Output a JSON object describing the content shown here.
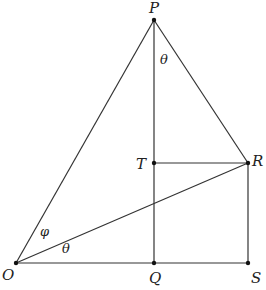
{
  "diagram": {
    "type": "geometry",
    "colors": {
      "line": "#333333",
      "point": "#111111",
      "text": "#222222",
      "background": "#ffffff"
    },
    "points": [
      {
        "id": "P",
        "label": "P",
        "x": 154,
        "y": 20
      },
      {
        "id": "T",
        "label": "T",
        "x": 154,
        "y": 163
      },
      {
        "id": "R",
        "label": "R",
        "x": 248,
        "y": 163
      },
      {
        "id": "O",
        "label": "O",
        "x": 16,
        "y": 263
      },
      {
        "id": "Q",
        "label": "Q",
        "x": 154,
        "y": 263
      },
      {
        "id": "S",
        "label": "S",
        "x": 248,
        "y": 263
      }
    ],
    "segments": [
      [
        "O",
        "P"
      ],
      [
        "P",
        "R"
      ],
      [
        "P",
        "Q"
      ],
      [
        "T",
        "R"
      ],
      [
        "O",
        "R"
      ],
      [
        "R",
        "S"
      ],
      [
        "O",
        "S"
      ]
    ],
    "labels": {
      "P": "P",
      "T": "T",
      "R": "R",
      "O": "O",
      "Q": "Q",
      "S": "S",
      "angle_at_P": "θ",
      "angle_phi_at_O": "φ",
      "angle_theta_at_O": "θ"
    }
  }
}
